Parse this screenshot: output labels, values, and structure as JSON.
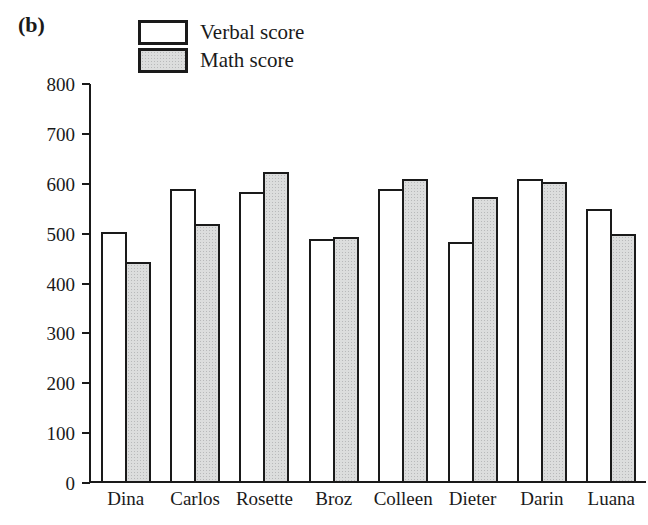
{
  "panel_label": "(b)",
  "colors": {
    "axis": "#1a1a1a",
    "bar_border": "#1a1a1a",
    "verbal_fill": "#ffffff",
    "math_fill": "#dcdddd"
  },
  "chart_data": {
    "type": "bar",
    "title": "",
    "xlabel": "",
    "ylabel": "",
    "categories": [
      "Dina",
      "Carlos",
      "Rosette",
      "Broz",
      "Colleen",
      "Dieter",
      "Darin",
      "Luana"
    ],
    "series": [
      {
        "name": "Verbal score",
        "values": [
          500,
          585,
          580,
          485,
          585,
          480,
          605,
          545
        ]
      },
      {
        "name": "Math score",
        "values": [
          440,
          515,
          620,
          490,
          605,
          570,
          600,
          495
        ]
      }
    ],
    "ylim": [
      0,
      800
    ],
    "yticks": [
      0,
      100,
      200,
      300,
      400,
      500,
      600,
      700,
      800
    ],
    "grid": false,
    "legend_position": "top-left"
  }
}
